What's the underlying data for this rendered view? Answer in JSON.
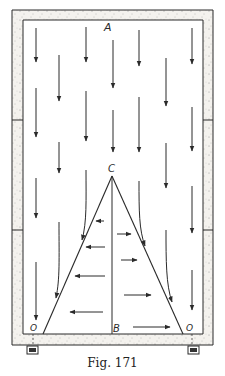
{
  "figure": {
    "caption": "Fig. 171",
    "labels": {
      "top": "A",
      "apex": "C",
      "base_center": "B",
      "corner_left": "O",
      "corner_right": "O"
    },
    "colors": {
      "line": "#2a2a2a",
      "wall_fill": "#f4f2ee",
      "speckle": "#8a8a8a",
      "background": "#ffffff"
    },
    "frame": {
      "outer": {
        "x1": 12,
        "y1": 10,
        "x2": 213,
        "y2": 345
      },
      "inner": {
        "x1": 23,
        "y1": 20,
        "x2": 203,
        "y2": 334
      },
      "wall_joints_y": [
        120,
        230
      ]
    },
    "triangle": {
      "apex": [
        112,
        176
      ],
      "base_left": [
        43,
        334
      ],
      "base_right": [
        183,
        334
      ],
      "center_line_bottom": [
        112,
        334
      ]
    },
    "down_arrows": [
      {
        "x": 36,
        "y1": 28,
        "y2": 62
      },
      {
        "x": 86,
        "y1": 27,
        "y2": 62
      },
      {
        "x": 139,
        "y1": 30,
        "y2": 66
      },
      {
        "x": 192,
        "y1": 28,
        "y2": 64
      },
      {
        "x": 59,
        "y1": 55,
        "y2": 101
      },
      {
        "x": 113,
        "y1": 40,
        "y2": 88
      },
      {
        "x": 166,
        "y1": 58,
        "y2": 106
      },
      {
        "x": 36,
        "y1": 88,
        "y2": 137
      },
      {
        "x": 86,
        "y1": 91,
        "y2": 141
      },
      {
        "x": 113,
        "y1": 110,
        "y2": 152
      },
      {
        "x": 139,
        "y1": 97,
        "y2": 152
      },
      {
        "x": 192,
        "y1": 107,
        "y2": 151
      },
      {
        "x": 59,
        "y1": 142,
        "y2": 173
      },
      {
        "x": 166,
        "y1": 143,
        "y2": 188
      },
      {
        "x": 36,
        "y1": 178,
        "y2": 218
      },
      {
        "x": 192,
        "y1": 186,
        "y2": 233
      },
      {
        "x": 36,
        "y1": 262,
        "y2": 320
      },
      {
        "x": 192,
        "y1": 270,
        "y2": 310
      }
    ],
    "curved_arrows": [
      {
        "path": "M86,170 C86,200 87,222 82,240",
        "end": [
          82,
          240
        ]
      },
      {
        "path": "M59,222 C59,260 60,278 56,298",
        "end": [
          56,
          298
        ]
      },
      {
        "path": "M139,181 C139,210 139,230 145,246",
        "end": [
          145,
          246
        ]
      },
      {
        "path": "M166,230 C166,260 166,285 172,302",
        "end": [
          172,
          302
        ]
      }
    ],
    "horizontal_arrows": [
      {
        "y": 221,
        "x1": 104,
        "x2": 96
      },
      {
        "y": 234,
        "x1": 117,
        "x2": 131
      },
      {
        "y": 247,
        "x1": 105,
        "x2": 86
      },
      {
        "y": 260,
        "x1": 121,
        "x2": 137
      },
      {
        "y": 276,
        "x1": 105,
        "x2": 75
      },
      {
        "y": 295,
        "x1": 124,
        "x2": 151
      },
      {
        "y": 312,
        "x1": 103,
        "x2": 70
      },
      {
        "y": 327,
        "x1": 133,
        "x2": 170
      }
    ],
    "feet": [
      {
        "x": 27,
        "y": 346,
        "w": 11,
        "h": 8
      },
      {
        "x": 188,
        "y": 346,
        "w": 11,
        "h": 8
      }
    ]
  }
}
